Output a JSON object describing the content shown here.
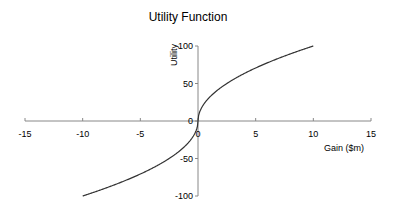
{
  "chart_data": {
    "type": "line",
    "title": "Utility Function",
    "xlabel": "Gain ($m)",
    "ylabel": "Utility",
    "xlim": [
      -15,
      15
    ],
    "ylim": [
      -100,
      100
    ],
    "x_ticks": [
      -15,
      -10,
      -5,
      0,
      5,
      10,
      15
    ],
    "y_ticks": [
      -100,
      -50,
      0,
      50,
      100
    ],
    "grid": false,
    "legend": null,
    "series": [
      {
        "name": "Utility",
        "color": "#333333",
        "x": [
          -10,
          -8,
          -6,
          -4,
          -2,
          -1,
          -0.5,
          -0.1,
          0,
          0.1,
          0.5,
          1,
          2,
          4,
          6,
          8,
          10
        ],
        "y": [
          -100,
          -89.4,
          -77.5,
          -63.2,
          -44.7,
          -31.6,
          -22.4,
          -10,
          0,
          10,
          22.4,
          31.6,
          44.7,
          63.2,
          77.5,
          89.4,
          100
        ]
      }
    ]
  }
}
